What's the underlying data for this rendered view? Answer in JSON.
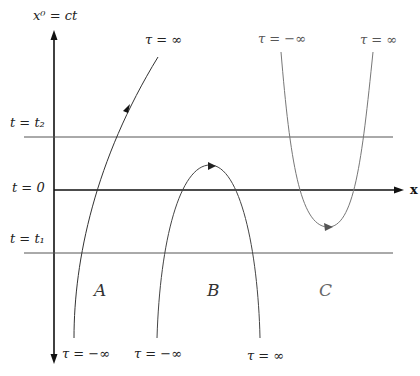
{
  "axes": {
    "vertical_label": "x⁰ = ct",
    "horizontal_label": "x"
  },
  "horizontal_lines": [
    {
      "label": "t = t₂",
      "name": "t2"
    },
    {
      "label": "t = 0",
      "name": "t0"
    },
    {
      "label": "t = t₁",
      "name": "t1"
    }
  ],
  "worldlines": [
    {
      "region": "A",
      "start_label": "τ = −∞",
      "end_label": "τ = ∞"
    },
    {
      "region": "B",
      "start_label": "τ = −∞",
      "end_label": "τ = ∞"
    },
    {
      "region": "C",
      "start_label": "τ = −∞",
      "end_label": "τ = ∞"
    }
  ],
  "colors": {
    "axis": "#111111",
    "line": "#444444",
    "curve_C": "#777777"
  }
}
